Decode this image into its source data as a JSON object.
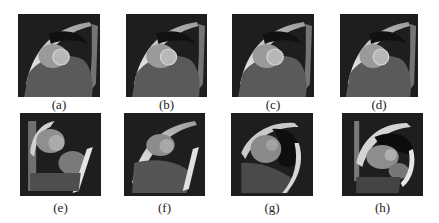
{
  "figure": {
    "panels": [
      {
        "id": "a",
        "label": "(a)",
        "x": 18,
        "y": 14,
        "w": 82,
        "h": 83,
        "cap_y": 97,
        "variant": "top"
      },
      {
        "id": "b",
        "label": "(b)",
        "x": 126,
        "y": 14,
        "w": 81,
        "h": 83,
        "cap_y": 97,
        "variant": "top"
      },
      {
        "id": "c",
        "label": "(c)",
        "x": 232,
        "y": 14,
        "w": 82,
        "h": 83,
        "cap_y": 97,
        "variant": "top"
      },
      {
        "id": "d",
        "label": "(d)",
        "x": 340,
        "y": 14,
        "w": 78,
        "h": 83,
        "cap_y": 97,
        "variant": "top"
      },
      {
        "id": "e",
        "label": "(e)",
        "x": 20,
        "y": 113,
        "w": 81,
        "h": 83,
        "cap_y": 200,
        "variant": "e"
      },
      {
        "id": "f",
        "label": "(f)",
        "x": 124,
        "y": 113,
        "w": 81,
        "h": 83,
        "cap_y": 200,
        "variant": "f"
      },
      {
        "id": "g",
        "label": "(g)",
        "x": 231,
        "y": 113,
        "w": 82,
        "h": 83,
        "cap_y": 200,
        "variant": "g"
      },
      {
        "id": "h",
        "label": "(h)",
        "x": 342,
        "y": 113,
        "w": 81,
        "h": 83,
        "cap_y": 200,
        "variant": "h"
      }
    ]
  }
}
